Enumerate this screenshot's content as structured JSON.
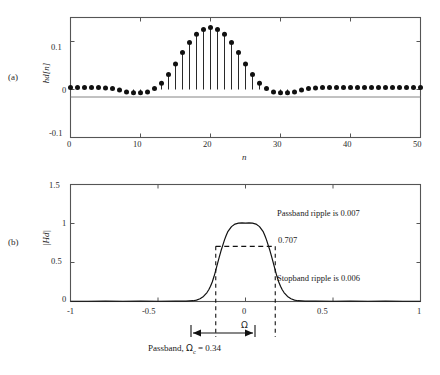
{
  "figure": {
    "panel_a_label": "(a)",
    "panel_b_label": "(b)"
  },
  "panel_a": {
    "ylabel": "hd[n]",
    "xlabel": "n",
    "y_ticks": [
      "0.1",
      "0",
      "-0.1"
    ],
    "x_ticks": [
      "0",
      "10",
      "20",
      "30",
      "40",
      "50"
    ]
  },
  "panel_b": {
    "ylabel": "|Hd|",
    "xlabel": "Ω",
    "y_ticks": [
      "1.5",
      "1",
      "0.5",
      "0"
    ],
    "x_ticks": [
      "-1",
      "-0.5",
      "0",
      "0.5",
      "1"
    ],
    "annotations": {
      "passband_ripple": "Passband ripple is 0.007",
      "stopband_ripple": "Stopband ripple is 0.006",
      "half_power": "0.707",
      "caption_prefix": "Passband, ",
      "caption_symbol": "Ω",
      "caption_sub": "c",
      "caption_value": " = 0.34"
    }
  },
  "chart_data": [
    {
      "type": "stem",
      "id": "impulse-response",
      "title": "",
      "xlabel": "n",
      "ylabel": "hd[n]",
      "xlim": [
        0,
        50
      ],
      "ylim": [
        -0.1,
        0.15
      ],
      "yticks": [
        -0.1,
        0,
        0.1
      ],
      "xticks": [
        0,
        10,
        20,
        30,
        40,
        50
      ],
      "grid": false,
      "x": [
        0,
        1,
        2,
        3,
        4,
        5,
        6,
        7,
        8,
        9,
        10,
        11,
        12,
        13,
        14,
        15,
        16,
        17,
        18,
        19,
        20,
        21,
        22,
        23,
        24,
        25,
        26,
        27,
        28,
        29,
        30,
        31,
        32,
        33,
        34,
        35,
        36,
        37,
        38,
        39,
        40,
        41,
        42,
        43,
        44,
        45,
        46,
        47,
        48,
        49,
        50
      ],
      "values": [
        0.004,
        0.004,
        0.004,
        0.004,
        0.004,
        0.003,
        0.002,
        -0.001,
        -0.005,
        -0.007,
        -0.007,
        -0.005,
        0.002,
        0.013,
        0.031,
        0.053,
        0.077,
        0.098,
        0.115,
        0.125,
        0.129,
        0.125,
        0.115,
        0.098,
        0.077,
        0.053,
        0.031,
        0.013,
        0.002,
        -0.005,
        -0.007,
        -0.007,
        -0.005,
        -0.001,
        0.002,
        0.003,
        0.004,
        0.004,
        0.004,
        0.004,
        0.004,
        0.004,
        0.004,
        0.004,
        0.004,
        0.004,
        0.004,
        0.004,
        0.004,
        0.004,
        0.004
      ]
    },
    {
      "type": "line",
      "id": "magnitude-response",
      "title": "",
      "xlabel": "Ω",
      "ylabel": "|Hd|",
      "xlim": [
        -1,
        1
      ],
      "ylim": [
        0,
        1.5
      ],
      "yticks": [
        0,
        0.5,
        1,
        1.5
      ],
      "xticks": [
        -1,
        -0.5,
        0,
        0.5,
        1
      ],
      "grid": false,
      "passband_ripple": 0.007,
      "stopband_ripple": 0.006,
      "half_power_level": 0.707,
      "cutoff": 0.34,
      "passband_edges": [
        -0.17,
        0.17
      ],
      "x": [
        -1.0,
        -0.9,
        -0.8,
        -0.7,
        -0.6,
        -0.5,
        -0.4,
        -0.34,
        -0.3,
        -0.28,
        -0.26,
        -0.24,
        -0.22,
        -0.21,
        -0.2,
        -0.19,
        -0.18,
        -0.17,
        -0.16,
        -0.15,
        -0.14,
        -0.13,
        -0.12,
        -0.11,
        -0.1,
        -0.08,
        -0.06,
        -0.04,
        -0.02,
        0.0,
        0.02,
        0.04,
        0.06,
        0.08,
        0.1,
        0.11,
        0.12,
        0.13,
        0.14,
        0.15,
        0.16,
        0.17,
        0.18,
        0.19,
        0.2,
        0.21,
        0.22,
        0.24,
        0.26,
        0.28,
        0.3,
        0.34,
        0.4,
        0.5,
        0.6,
        0.7,
        0.8,
        0.9,
        1.0
      ],
      "values": [
        0.003,
        0.003,
        0.004,
        0.003,
        0.004,
        0.003,
        0.004,
        0.005,
        0.01,
        0.018,
        0.035,
        0.065,
        0.115,
        0.15,
        0.195,
        0.25,
        0.32,
        0.4,
        0.485,
        0.57,
        0.65,
        0.72,
        0.79,
        0.85,
        0.9,
        0.96,
        0.993,
        1.005,
        1.007,
        1.006,
        1.007,
        1.005,
        0.993,
        0.96,
        0.9,
        0.85,
        0.79,
        0.72,
        0.65,
        0.57,
        0.485,
        0.4,
        0.32,
        0.25,
        0.195,
        0.15,
        0.115,
        0.065,
        0.035,
        0.018,
        0.01,
        0.005,
        0.004,
        0.003,
        0.004,
        0.003,
        0.004,
        0.003,
        0.003
      ]
    }
  ]
}
